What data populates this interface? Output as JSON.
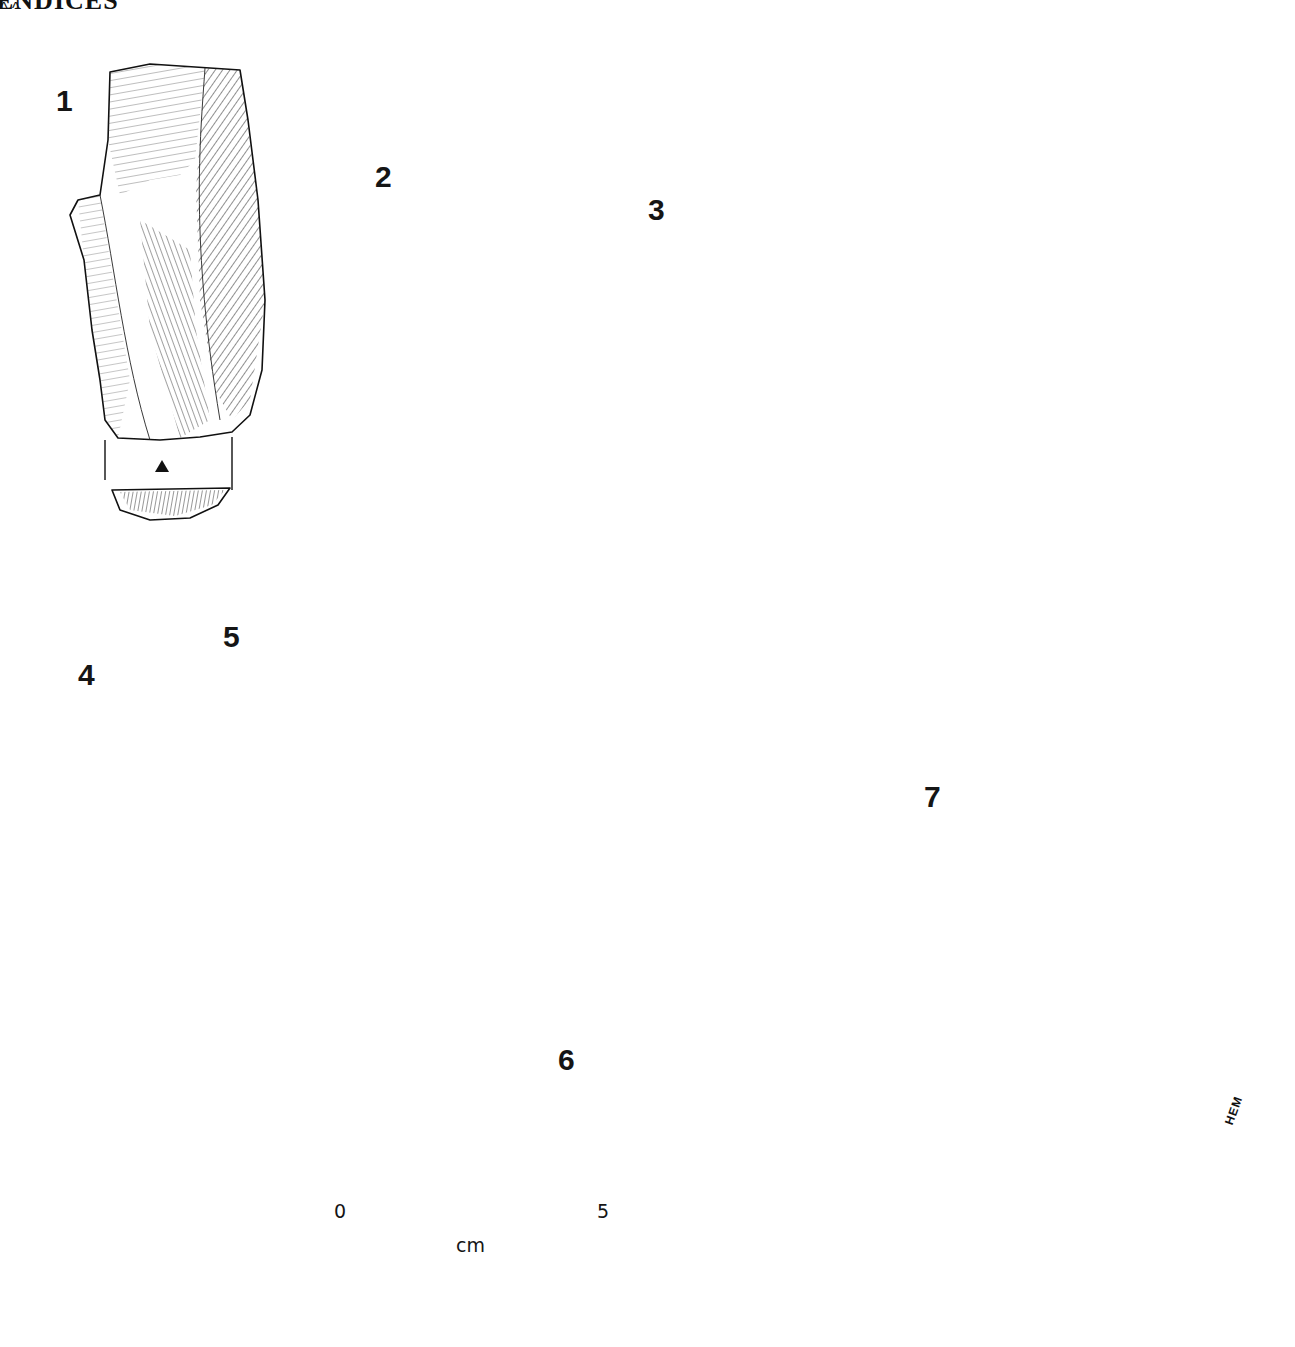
{
  "header": {
    "text": "ENDICES"
  },
  "plate": {
    "figures": [
      {
        "id": "1",
        "label": "1"
      },
      {
        "id": "2",
        "label": "2"
      },
      {
        "id": "3",
        "label": "3"
      },
      {
        "id": "4",
        "label": "4"
      },
      {
        "id": "5",
        "label": "5"
      },
      {
        "id": "6",
        "label": "6"
      },
      {
        "id": "7",
        "label": "7"
      }
    ],
    "scale_bar": {
      "start_label": "0",
      "end_label": "5",
      "unit_label": "cm",
      "divisions": 5
    },
    "signature": "HEM",
    "colors": {
      "ink": "#111111",
      "paper": "#ffffff"
    }
  }
}
